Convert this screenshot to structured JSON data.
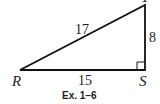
{
  "figure": {
    "vertices": {
      "R": "R",
      "S": "S",
      "T": "T"
    },
    "sides": {
      "hypotenuse_RT": "17",
      "leg_RS": "15",
      "leg_ST": "8"
    },
    "right_angle_at": "S",
    "caption": "Ex. 1–6"
  }
}
